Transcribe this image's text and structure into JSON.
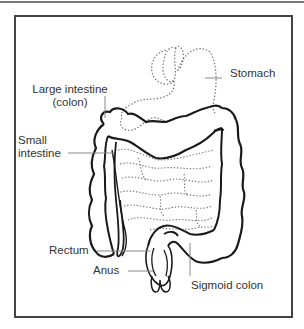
{
  "diagram": {
    "colors": {
      "outline": "#1a1a1a",
      "dotted": "#777777",
      "leader": "#888888",
      "frame": "#444444",
      "text": "#333333"
    },
    "labels": {
      "stomach": "Stomach",
      "large_intestine_line1": "Large intestine",
      "large_intestine_line2": "(colon)",
      "small_intestine_line1": "Small",
      "small_intestine_line2": "intestine",
      "rectum": "Rectum",
      "anus": "Anus",
      "sigmoid_colon": "Sigmoid colon"
    }
  }
}
